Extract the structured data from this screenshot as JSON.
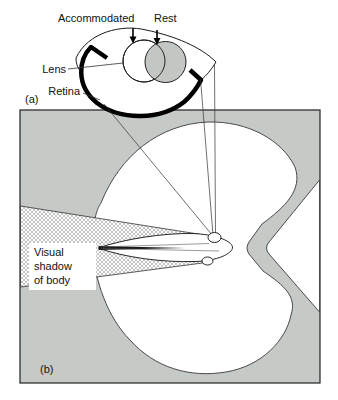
{
  "panel_a": {
    "label": "(a)",
    "accommodated_label": "Accommodated",
    "rest_label": "Rest",
    "lens_label": "Lens",
    "retina_label": "Retina"
  },
  "panel_b": {
    "label": "(b)",
    "shadow_lines": [
      "Visual",
      "shadow",
      "of body"
    ]
  },
  "colors": {
    "panel_gray": "#c6cac7",
    "rest_lens_gray": "#c3c7c4",
    "outline": "#1a1a1a",
    "background": "#ffffff"
  }
}
